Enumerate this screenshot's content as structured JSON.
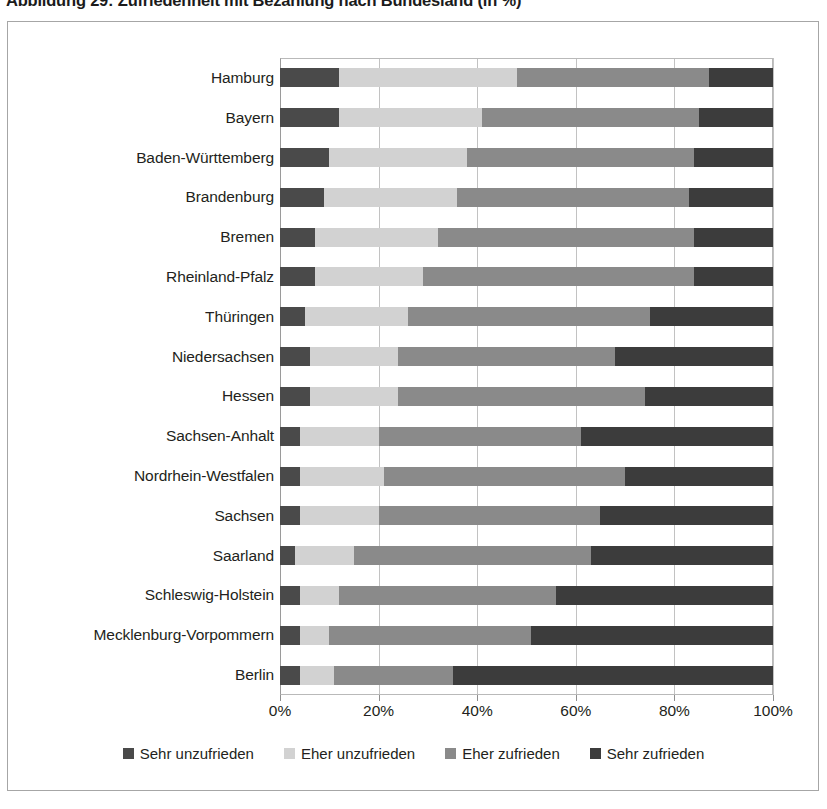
{
  "figure": {
    "title": "Abbildung 29: Zufriedenheit mit Bezahlung nach Bundesland (in %)"
  },
  "chart_data": {
    "type": "bar",
    "orientation": "horizontal",
    "stacked": true,
    "normalized": true,
    "title": "Abbildung 29: Zufriedenheit mit Bezahlung nach Bundesland (in %)",
    "xlabel": "",
    "ylabel": "",
    "xlim": [
      0,
      100
    ],
    "xticks": [
      "0%",
      "20%",
      "40%",
      "60%",
      "80%",
      "100%"
    ],
    "xtick_values": [
      0,
      20,
      40,
      60,
      80,
      100
    ],
    "grid": true,
    "legend_position": "bottom",
    "categories": [
      "Hamburg",
      "Bayern",
      "Baden-Württemberg",
      "Brandenburg",
      "Bremen",
      "Rheinland-Pfalz",
      "Thüringen",
      "Niedersachsen",
      "Hessen",
      "Sachsen-Anhalt",
      "Nordrhein-Westfalen",
      "Sachsen",
      "Saarland",
      "Schleswig-Holstein",
      "Mecklenburg-Vorpommern",
      "Berlin"
    ],
    "series": [
      {
        "name": "Sehr unzufrieden",
        "color": "#4a4a4a",
        "values": [
          12,
          12,
          10,
          9,
          7,
          7,
          5,
          6,
          6,
          4,
          4,
          4,
          3,
          4,
          4,
          4
        ]
      },
      {
        "name": "Eher unzufrieden",
        "color": "#d2d2d2",
        "values": [
          36,
          29,
          28,
          27,
          25,
          22,
          21,
          18,
          18,
          16,
          17,
          16,
          12,
          8,
          6,
          7
        ]
      },
      {
        "name": "Eher zufrieden",
        "color": "#8a8a8a",
        "values": [
          39,
          44,
          46,
          47,
          52,
          55,
          49,
          44,
          50,
          41,
          49,
          45,
          48,
          44,
          41,
          24
        ]
      },
      {
        "name": "Sehr zufrieden",
        "color": "#3c3c3c",
        "values": [
          13,
          15,
          16,
          17,
          16,
          16,
          25,
          32,
          26,
          39,
          30,
          35,
          37,
          44,
          49,
          65
        ]
      }
    ]
  },
  "legend": {
    "items": [
      {
        "label": "Sehr unzufrieden"
      },
      {
        "label": "Eher unzufrieden"
      },
      {
        "label": "Eher zufrieden"
      },
      {
        "label": "Sehr zufrieden"
      }
    ]
  }
}
